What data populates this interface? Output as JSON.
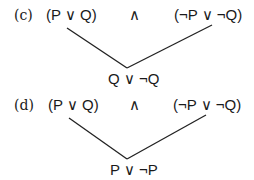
{
  "problems": [
    {
      "label": "(c)",
      "left_clause": "(P ∨ Q)",
      "operator": "∧",
      "right_clause": "(¬P ∨ ¬Q)",
      "resolvent": "Q ∨ ¬Q"
    },
    {
      "label": "(d)",
      "left_clause": "(P ∨ Q)",
      "operator": "∧",
      "right_clause": "(¬P ∨ ¬Q)",
      "resolvent": "P ∨ ¬P"
    }
  ],
  "colors": {
    "text": "#1a1a1a",
    "line": "#222222",
    "background": "#ffffff"
  }
}
